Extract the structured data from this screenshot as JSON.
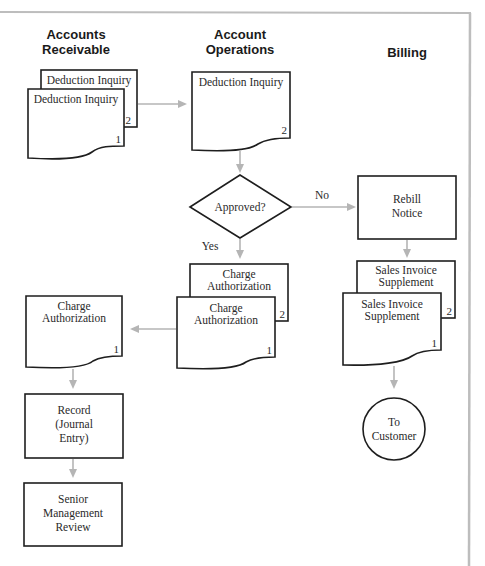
{
  "headers": {
    "accounts_receivable": [
      "Accounts",
      "Receivable"
    ],
    "account_operations": [
      "Account",
      "Operations"
    ],
    "billing": "Billing"
  },
  "nodes": {
    "ar_deduction_copy2": {
      "label": "Deduction Inquiry",
      "copy": "2"
    },
    "ar_deduction_copy1": {
      "label": "Deduction Inquiry",
      "copy": "1"
    },
    "ao_deduction": {
      "label": "Deduction Inquiry",
      "copy": "2"
    },
    "decision": {
      "label": "Approved?"
    },
    "no_label": "No",
    "yes_label": "Yes",
    "rebill": {
      "lines": [
        "Rebill",
        "Notice"
      ]
    },
    "ao_charge_copy2": {
      "lines": [
        "Charge",
        "Authorization"
      ],
      "copy": "2"
    },
    "ao_charge_copy1": {
      "lines": [
        "Charge",
        "Authorization"
      ],
      "copy": "1"
    },
    "ar_charge": {
      "lines": [
        "Charge",
        "Authorization"
      ],
      "copy": "1"
    },
    "record": {
      "lines": [
        "Record",
        "(Journal",
        "Entry)"
      ]
    },
    "senior": {
      "lines": [
        "Senior",
        "Management",
        "Review"
      ]
    },
    "sis_copy2": {
      "lines": [
        "Sales Invoice",
        "Supplement"
      ],
      "copy": "2"
    },
    "sis_copy1": {
      "lines": [
        "Sales Invoice",
        "Supplement"
      ],
      "copy": "1"
    },
    "to_customer": {
      "lines": [
        "To",
        "Customer"
      ]
    }
  },
  "colors": {
    "border": "#1e1e1e",
    "arrow": "#b5b5b5",
    "frame": "#bdbdbd"
  }
}
